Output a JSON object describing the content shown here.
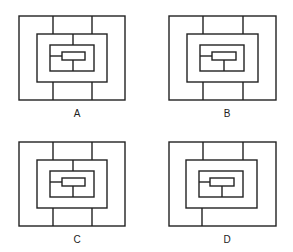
{
  "figures": [
    {
      "label": "A",
      "outer_top_dividers": 2,
      "outer_bottom_dividers": 2,
      "middle_top_divider": true,
      "inner_left_connector": true,
      "inner_bottom_connector": true
    },
    {
      "label": "B",
      "outer_top_dividers": 2,
      "outer_bottom_dividers": 2,
      "middle_top_divider": false,
      "inner_left_connector": true,
      "inner_bottom_connector": true
    },
    {
      "label": "C",
      "outer_top_dividers": 2,
      "outer_bottom_dividers": 2,
      "middle_top_divider": true,
      "inner_left_connector": true,
      "inner_bottom_connector": true
    },
    {
      "label": "D",
      "outer_top_dividers": 2,
      "outer_bottom_dividers": 1,
      "middle_top_divider": false,
      "inner_left_connector": true,
      "inner_bottom_connector": true
    }
  ],
  "colors": {
    "line": "#222222",
    "background": "#ffffff"
  }
}
